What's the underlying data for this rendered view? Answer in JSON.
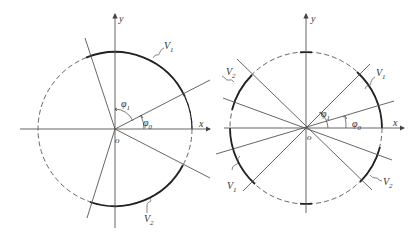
{
  "figure": {
    "left": {
      "axis_x_label": "x",
      "axis_y_label": "y",
      "origin_label": "o",
      "angle_1": {
        "symbol": "φ",
        "sub": "1"
      },
      "angle_0": {
        "symbol": "φ",
        "sub": "0"
      },
      "region_1": {
        "symbol": "V",
        "sub": "1"
      },
      "region_2": {
        "symbol": "V",
        "sub": "2"
      }
    },
    "right": {
      "axis_x_label": "x",
      "axis_y_label": "y",
      "origin_label": "o",
      "angle_1": {
        "symbol": "φ",
        "sub": "1"
      },
      "angle_0": {
        "symbol": "φ",
        "sub": "0"
      },
      "region_1_upper": {
        "symbol": "V",
        "sub": "1"
      },
      "region_1_lower": {
        "symbol": "V",
        "sub": "1"
      },
      "region_2_upper": {
        "symbol": "V",
        "sub": "2"
      },
      "region_2_lower": {
        "symbol": "V",
        "sub": "2"
      }
    },
    "colors": {
      "line": "#555555",
      "arc_solid": "#222222",
      "arc_dashed": "#666666"
    }
  }
}
